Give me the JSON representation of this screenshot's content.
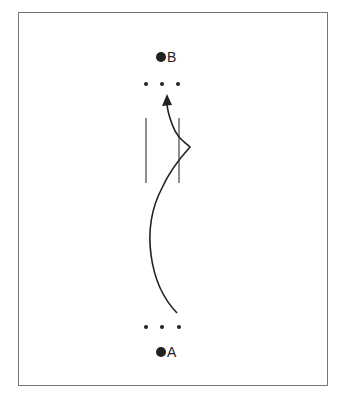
{
  "diagram": {
    "points": {
      "start": {
        "label": "A"
      },
      "end": {
        "label": "B"
      }
    },
    "elements": [
      "point-B",
      "dots-row-top",
      "parallel-lines",
      "curved-path-arrow",
      "dots-row-bottom",
      "point-A"
    ],
    "colors": {
      "ink": "#222222",
      "frame": "#777777",
      "background": "#ffffff"
    }
  }
}
